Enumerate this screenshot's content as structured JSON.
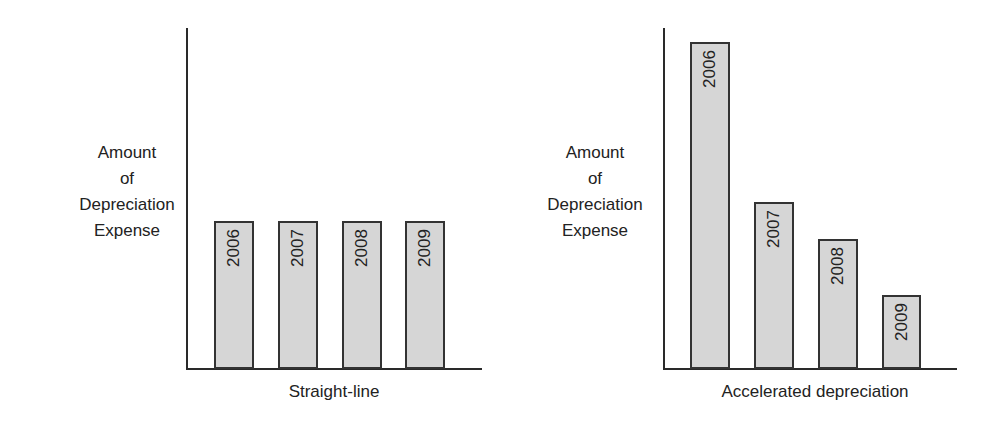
{
  "chart_data": [
    {
      "type": "bar",
      "title": "",
      "xlabel": "Straight-line",
      "ylabel": "Amount of Depreciation Expense",
      "ylabel_lines": [
        "Amount",
        "of",
        "Depreciation",
        "Expense"
      ],
      "categories": [
        "2006",
        "2007",
        "2008",
        "2009"
      ],
      "values": [
        43.4,
        43.4,
        43.4,
        43.4
      ],
      "ylim": [
        0,
        100
      ],
      "value_units": "relative (axis height = 100; no numeric ticks shown)",
      "grid": false,
      "legend": null,
      "bar_labels_inside_rotated": true,
      "colors": {
        "bar_fill": "#d6d6d6",
        "bar_border": "#333333",
        "axis": "#2a2a2a"
      }
    },
    {
      "type": "bar",
      "title": "",
      "xlabel": "Accelerated depreciation",
      "ylabel": "Amount of Depreciation Expense",
      "ylabel_lines": [
        "Amount",
        "of",
        "Depreciation",
        "Expense"
      ],
      "categories": [
        "2006",
        "2007",
        "2008",
        "2009"
      ],
      "values": [
        95.9,
        49.0,
        38.1,
        21.7
      ],
      "ylim": [
        0,
        100
      ],
      "value_units": "relative (axis height = 100; no numeric ticks shown)",
      "grid": false,
      "legend": null,
      "bar_labels_inside_rotated": true,
      "colors": {
        "bar_fill": "#d6d6d6",
        "bar_border": "#333333",
        "axis": "#2a2a2a"
      }
    }
  ]
}
